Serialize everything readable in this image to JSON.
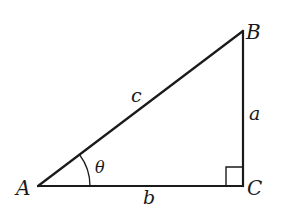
{
  "figure": {
    "type": "right-triangle",
    "stroke_color": "#1a1a1a",
    "background": "#ffffff",
    "vertices": {
      "A": {
        "label": "A",
        "x": 38,
        "y": 186
      },
      "B": {
        "label": "B",
        "x": 243,
        "y": 31
      },
      "C": {
        "label": "C",
        "x": 243,
        "y": 186
      }
    },
    "sides": {
      "hypotenuse": {
        "label": "c",
        "from": "A",
        "to": "B"
      },
      "vertical_leg": {
        "label": "a",
        "from": "B",
        "to": "C"
      },
      "horizontal_leg": {
        "label": "b",
        "from": "A",
        "to": "C"
      }
    },
    "angle": {
      "label": "θ",
      "at": "A"
    },
    "right_angle_marker": {
      "at": "C"
    }
  }
}
